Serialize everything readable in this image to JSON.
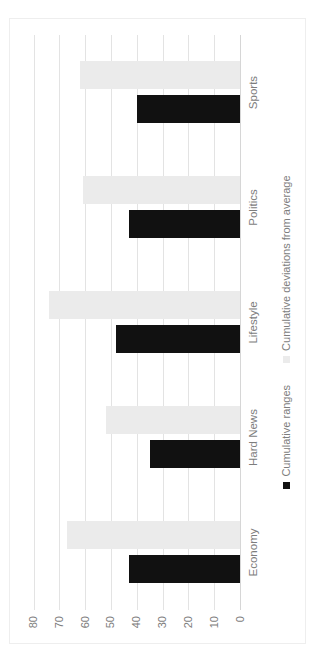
{
  "chart_data": {
    "type": "bar",
    "note_orientation": "clustered column chart rendered rotated 90 degrees counterclockwise",
    "categories": [
      "Economy",
      "Hard News",
      "Lifestyle",
      "Politics",
      "Sports"
    ],
    "series": [
      {
        "name": "Cumulative ranges",
        "color": "#111111",
        "values": [
          43,
          35,
          48,
          43,
          40
        ]
      },
      {
        "name": "Cumulative deviations from average",
        "color": "#ebebeb",
        "values": [
          67,
          52,
          74,
          61,
          62
        ]
      }
    ],
    "ylim": [
      0,
      80
    ],
    "ytick_step": 10,
    "tick_labels": [
      "0",
      "10",
      "20",
      "30",
      "40",
      "50",
      "60",
      "70",
      "80"
    ],
    "grid": true,
    "legend_position": "bottom"
  },
  "colors": {
    "background": "#ffffff",
    "gridline": "#e3e3e3",
    "axis_line": "#d6d6d6",
    "label_text": "#7d7d7d",
    "frame_border": "#eeeeee"
  }
}
